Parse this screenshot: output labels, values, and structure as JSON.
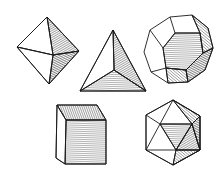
{
  "figure": {
    "title": "The five Platonic solids",
    "style": "pen-and-ink line illustration with hatched shading",
    "ink_color": "#1a1a1a",
    "background": "#ffffff",
    "solids": [
      {
        "name": "octahedron",
        "position": "top-left"
      },
      {
        "name": "tetrahedron",
        "position": "top-center"
      },
      {
        "name": "dodecahedron",
        "position": "top-right"
      },
      {
        "name": "cube",
        "position": "bottom-left"
      },
      {
        "name": "icosahedron",
        "position": "bottom-right"
      }
    ]
  }
}
